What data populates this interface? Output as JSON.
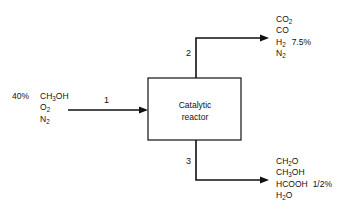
{
  "diagram": {
    "type": "process-flow-diagram",
    "unit": {
      "name": "Catalytic reactor",
      "label_line1": "Catalytic",
      "label_line2": "reactor"
    },
    "streams": [
      {
        "number": "1",
        "role": "feed",
        "direction": "into-reactor",
        "percent_label": "40%",
        "species": [
          {
            "formula": "CH3OH",
            "html": "CH<sub>3</sub>OH",
            "annotation": ""
          },
          {
            "formula": "O2",
            "html": "O<sub>2</sub>",
            "annotation": ""
          },
          {
            "formula": "N2",
            "html": "N<sub>2</sub>",
            "annotation": ""
          }
        ]
      },
      {
        "number": "2",
        "role": "outlet-top",
        "direction": "out-of-reactor",
        "percent_label": "",
        "species": [
          {
            "formula": "CO2",
            "html": "CO<sub>2</sub>",
            "annotation": ""
          },
          {
            "formula": "CO",
            "html": "CO",
            "annotation": ""
          },
          {
            "formula": "H2",
            "html": "H<sub>2</sub>",
            "annotation": "7.5%"
          },
          {
            "formula": "N2",
            "html": "N<sub>2</sub>",
            "annotation": ""
          }
        ]
      },
      {
        "number": "3",
        "role": "outlet-bottom",
        "direction": "out-of-reactor",
        "percent_label": "",
        "species": [
          {
            "formula": "CH2O",
            "html": "CH<sub>2</sub>O",
            "annotation": ""
          },
          {
            "formula": "CH3OH",
            "html": "CH<sub>3</sub>OH",
            "annotation": ""
          },
          {
            "formula": "HCOOH",
            "html": "HCOOH",
            "annotation": "1/2%"
          },
          {
            "formula": "H2O",
            "html": "H<sub>2</sub>O",
            "annotation": ""
          }
        ]
      }
    ],
    "colors": {
      "background": "#ffffff",
      "line": "#111111",
      "text": "#111111"
    }
  }
}
